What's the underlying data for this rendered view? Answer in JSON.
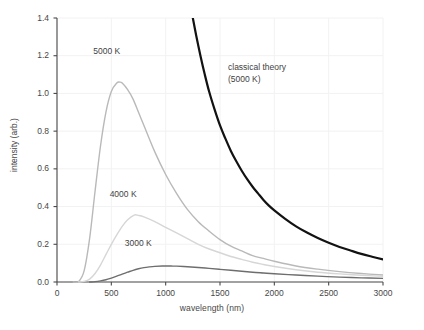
{
  "chart_data": {
    "type": "line",
    "title": "",
    "xlabel": "wavelength (nm)",
    "ylabel": "intensity (arb.)",
    "xlim": [
      0,
      3000
    ],
    "ylim": [
      0.0,
      1.4
    ],
    "xticks": [
      "0",
      "500",
      "1000",
      "1500",
      "2000",
      "2500",
      "3000"
    ],
    "yticks": [
      "0.0",
      "0.2",
      "0.4",
      "0.6",
      "0.8",
      "1.0",
      "1.2",
      "1.4"
    ],
    "grid": true,
    "legend_position": "inline-annotations",
    "annotations": [
      {
        "text": "5000 K",
        "x": 500,
        "y": 1.22
      },
      {
        "text": "4000 K",
        "x": 650,
        "y": 0.46
      },
      {
        "text": "3000 K",
        "x": 790,
        "y": 0.2
      },
      {
        "text": "classical theory",
        "x": 1560,
        "y": 1.17
      },
      {
        "text": "(5000 K)",
        "x": 1560,
        "y": 1.11
      }
    ],
    "series": [
      {
        "name": "5000 K",
        "color": "#b9b9b9",
        "width": 1.4,
        "peak": {
          "x": 578,
          "y": 1.06
        },
        "points": [
          [
            150,
            0.0
          ],
          [
            200,
            0.003
          ],
          [
            250,
            0.06
          ],
          [
            300,
            0.23
          ],
          [
            350,
            0.48
          ],
          [
            400,
            0.72
          ],
          [
            450,
            0.9
          ],
          [
            500,
            1.01
          ],
          [
            550,
            1.055
          ],
          [
            578,
            1.06
          ],
          [
            600,
            1.055
          ],
          [
            650,
            1.02
          ],
          [
            700,
            0.97
          ],
          [
            750,
            0.9
          ],
          [
            800,
            0.83
          ],
          [
            900,
            0.69
          ],
          [
            1000,
            0.57
          ],
          [
            1100,
            0.47
          ],
          [
            1200,
            0.385
          ],
          [
            1300,
            0.32
          ],
          [
            1400,
            0.27
          ],
          [
            1500,
            0.225
          ],
          [
            1600,
            0.19
          ],
          [
            1700,
            0.165
          ],
          [
            1800,
            0.14
          ],
          [
            1900,
            0.125
          ],
          [
            2000,
            0.11
          ],
          [
            2200,
            0.085
          ],
          [
            2400,
            0.068
          ],
          [
            2600,
            0.055
          ],
          [
            2800,
            0.045
          ],
          [
            3000,
            0.037
          ]
        ]
      },
      {
        "name": "4000 K",
        "color": "#d6d6d6",
        "width": 1.4,
        "peak": {
          "x": 710,
          "y": 0.355
        },
        "points": [
          [
            200,
            0.0
          ],
          [
            250,
            0.003
          ],
          [
            300,
            0.015
          ],
          [
            350,
            0.045
          ],
          [
            400,
            0.09
          ],
          [
            450,
            0.145
          ],
          [
            500,
            0.2
          ],
          [
            550,
            0.25
          ],
          [
            600,
            0.295
          ],
          [
            650,
            0.33
          ],
          [
            710,
            0.355
          ],
          [
            750,
            0.353
          ],
          [
            800,
            0.345
          ],
          [
            900,
            0.32
          ],
          [
            1000,
            0.29
          ],
          [
            1100,
            0.26
          ],
          [
            1200,
            0.23
          ],
          [
            1300,
            0.2
          ],
          [
            1400,
            0.175
          ],
          [
            1500,
            0.155
          ],
          [
            1600,
            0.135
          ],
          [
            1700,
            0.12
          ],
          [
            1800,
            0.105
          ],
          [
            1900,
            0.093
          ],
          [
            2000,
            0.082
          ],
          [
            2200,
            0.065
          ],
          [
            2400,
            0.052
          ],
          [
            2600,
            0.043
          ],
          [
            2800,
            0.036
          ],
          [
            3000,
            0.03
          ]
        ]
      },
      {
        "name": "3000 K",
        "color": "#6e6e6e",
        "width": 1.4,
        "peak": {
          "x": 970,
          "y": 0.085
        },
        "points": [
          [
            300,
            0.0
          ],
          [
            350,
            0.002
          ],
          [
            400,
            0.006
          ],
          [
            450,
            0.012
          ],
          [
            500,
            0.021
          ],
          [
            550,
            0.031
          ],
          [
            600,
            0.042
          ],
          [
            650,
            0.052
          ],
          [
            700,
            0.062
          ],
          [
            750,
            0.07
          ],
          [
            800,
            0.076
          ],
          [
            850,
            0.08
          ],
          [
            900,
            0.083
          ],
          [
            970,
            0.085
          ],
          [
            1050,
            0.0845
          ],
          [
            1100,
            0.084
          ],
          [
            1200,
            0.081
          ],
          [
            1300,
            0.077
          ],
          [
            1400,
            0.072
          ],
          [
            1500,
            0.067
          ],
          [
            1600,
            0.062
          ],
          [
            1700,
            0.057
          ],
          [
            1800,
            0.052
          ],
          [
            1900,
            0.048
          ],
          [
            2000,
            0.044
          ],
          [
            2200,
            0.037
          ],
          [
            2400,
            0.031
          ],
          [
            2600,
            0.026
          ],
          [
            2800,
            0.022
          ],
          [
            3000,
            0.019
          ]
        ]
      },
      {
        "name": "classical theory (5000 K)",
        "color": "#121212",
        "width": 2.2,
        "points": [
          [
            1250,
            1.4
          ],
          [
            1280,
            1.31
          ],
          [
            1320,
            1.2
          ],
          [
            1360,
            1.1
          ],
          [
            1400,
            1.01
          ],
          [
            1450,
            0.915
          ],
          [
            1500,
            0.83
          ],
          [
            1550,
            0.76
          ],
          [
            1600,
            0.695
          ],
          [
            1650,
            0.64
          ],
          [
            1700,
            0.59
          ],
          [
            1750,
            0.545
          ],
          [
            1800,
            0.505
          ],
          [
            1850,
            0.47
          ],
          [
            1900,
            0.435
          ],
          [
            1950,
            0.405
          ],
          [
            2000,
            0.38
          ],
          [
            2100,
            0.335
          ],
          [
            2200,
            0.295
          ],
          [
            2300,
            0.262
          ],
          [
            2400,
            0.233
          ],
          [
            2500,
            0.208
          ],
          [
            2600,
            0.186
          ],
          [
            2700,
            0.167
          ],
          [
            2800,
            0.149
          ],
          [
            2900,
            0.134
          ],
          [
            3000,
            0.12
          ]
        ]
      }
    ]
  },
  "plot_geometry": {
    "left": 57,
    "right": 383,
    "top": 18,
    "bottom": 282
  },
  "colors": {
    "axis": "#4a4a4a",
    "grid": "#f2f2f2",
    "text": "#474747"
  }
}
